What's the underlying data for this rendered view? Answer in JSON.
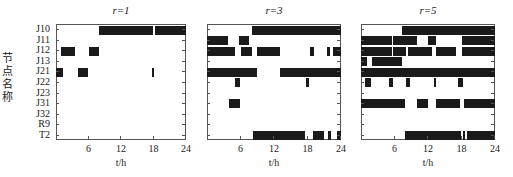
{
  "chart_data": {
    "type": "heatmap",
    "subtype": "gantt-binary",
    "ylabel": "节点名称",
    "xlabel": "t/h",
    "rows": [
      "J10",
      "J11",
      "J12",
      "J13",
      "J21",
      "J22",
      "J23",
      "J31",
      "J32",
      "R9",
      "T2"
    ],
    "xlim": [
      0,
      24
    ],
    "xticks": [
      6,
      12,
      18,
      24
    ],
    "panels": [
      {
        "title": "r=1",
        "blocks": {
          "J10": [
            [
              8,
              18
            ],
            [
              18.2,
              24
            ]
          ],
          "J12": [
            [
              1,
              3.5
            ],
            [
              6,
              8
            ]
          ],
          "J21": [
            [
              0,
              1.2
            ],
            [
              4,
              6
            ],
            [
              17.8,
              18.1
            ]
          ]
        }
      },
      {
        "title": "r=3",
        "blocks": {
          "J10": [
            [
              8,
              24
            ]
          ],
          "J11": [
            [
              0,
              3.8
            ],
            [
              5.8,
              7.5
            ]
          ],
          "J12": [
            [
              0,
              5
            ],
            [
              6,
              8
            ],
            [
              9,
              13
            ],
            [
              18.5,
              19.2
            ],
            [
              21.5,
              22
            ],
            [
              22.5,
              24
            ]
          ],
          "J21": [
            [
              0,
              9
            ],
            [
              13,
              24
            ]
          ],
          "J22": [
            [
              5,
              6
            ],
            [
              17.8,
              18.3
            ]
          ],
          "J31": [
            [
              4,
              6
            ]
          ],
          "T2": [
            [
              8.2,
              17.5
            ],
            [
              19,
              21
            ],
            [
              21.7,
              22.2
            ],
            [
              23.3,
              24
            ]
          ]
        }
      },
      {
        "title": "r=5",
        "blocks": {
          "J10": [
            [
              7.3,
              24
            ]
          ],
          "J11": [
            [
              0,
              5.5
            ],
            [
              5.8,
              10
            ],
            [
              12,
              13.5
            ],
            [
              18,
              24
            ]
          ],
          "J12": [
            [
              0,
              5.5
            ],
            [
              5.8,
              8
            ],
            [
              8.5,
              12.8
            ],
            [
              13.5,
              17
            ],
            [
              18,
              24
            ]
          ],
          "J13": [
            [
              0,
              1
            ],
            [
              2,
              7.3
            ]
          ],
          "J21": [
            [
              0,
              24
            ]
          ],
          "J22": [
            [
              0.8,
              1.8
            ],
            [
              5,
              5.8
            ],
            [
              8,
              8.8
            ],
            [
              13,
              13.4
            ],
            [
              17.3,
              18.2
            ]
          ],
          "J31": [
            [
              0,
              7.8
            ],
            [
              10,
              12
            ],
            [
              13.5,
              17.8
            ],
            [
              18.5,
              24
            ]
          ],
          "T2": [
            [
              7.8,
              18
            ],
            [
              18.3,
              18.7
            ],
            [
              18.9,
              24
            ]
          ]
        }
      }
    ]
  },
  "labels": {
    "ylabel": "节点名称",
    "xlabel": "t/h",
    "titles": [
      "r=1",
      "r=3",
      "r=5"
    ],
    "rows": [
      "J10",
      "J11",
      "J12",
      "J13",
      "J21",
      "J22",
      "J23",
      "J31",
      "J32",
      "R9",
      "T2"
    ],
    "xticks": [
      "6",
      "12",
      "18",
      "24"
    ]
  }
}
